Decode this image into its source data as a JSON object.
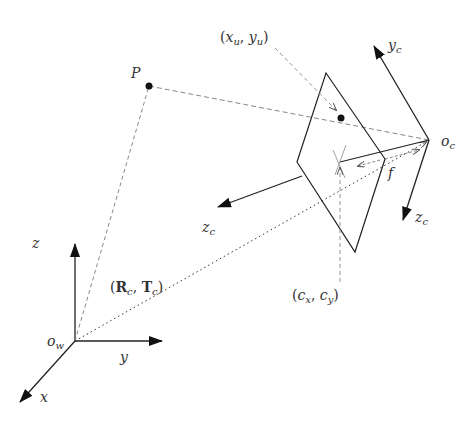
{
  "diagram": {
    "colors": {
      "line": "#222222",
      "dashed": "#888888",
      "dotted": "#333333",
      "background": "#ffffff"
    },
    "labels": {
      "P": "P",
      "projected_point": {
        "open": "(",
        "x": "x",
        "x_sub": "u",
        "sep": ", ",
        "y": "y",
        "y_sub": "u",
        "close": ")"
      },
      "camera_origin": {
        "base": "o",
        "sub": "c"
      },
      "camera_y": {
        "base": "y",
        "sub": "c"
      },
      "camera_z_left": {
        "base": "z",
        "sub": "c"
      },
      "camera_z_down": {
        "base": "z",
        "sub": "c"
      },
      "focal_length": "f",
      "principal_point": {
        "open": "(",
        "x": "c",
        "x_sub": "x",
        "sep": ", ",
        "y": "c",
        "y_sub": "y",
        "close": ")"
      },
      "extrinsics": {
        "open": "(",
        "R": "R",
        "R_sub": "c",
        "sep": ", ",
        "T": "T",
        "T_sub": "c",
        "close": ")"
      },
      "world_origin": {
        "base": "o",
        "sub": "w"
      },
      "world_x": "x",
      "world_y": "y",
      "world_z": "z"
    }
  }
}
